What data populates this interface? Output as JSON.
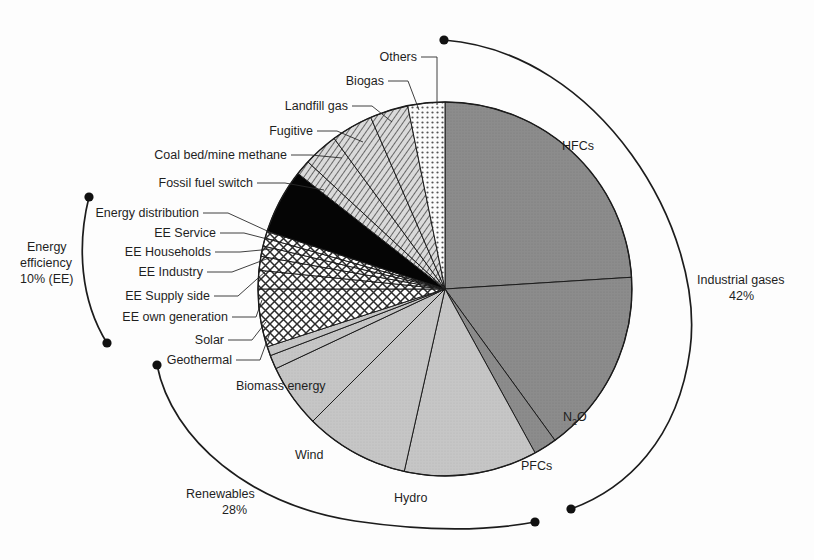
{
  "chart_data": {
    "type": "pie",
    "title": "",
    "subtitle": "",
    "xlabel": "",
    "ylabel": "",
    "legend_position": "callout-labels",
    "grid": false,
    "total_percent": 100,
    "units": "percent",
    "start_angle_deg": -90,
    "direction": "clockwise",
    "groups": [
      {
        "name": "Industrial gases",
        "percent": 42,
        "label": "Industrial gases",
        "value_label": "42%"
      },
      {
        "name": "Renewables",
        "percent": 28,
        "label": "Renewables",
        "value_label": "28%"
      },
      {
        "name": "Energy efficiency",
        "percent": 10,
        "label": "Energy efficiency",
        "value_label": "10% (EE)"
      }
    ],
    "categories": [
      "HFCs",
      "N2O",
      "PFCs",
      "Hydro",
      "Wind",
      "Biomass energy",
      "Geothermal",
      "Solar",
      "EE own generation",
      "EE Supply side",
      "EE Industry",
      "EE Households",
      "EE Service",
      "Energy distribution",
      "Fossil fuel switch",
      "Coal bed/mine methane",
      "Fugitive",
      "Landfill gas",
      "Biogas",
      "Others"
    ],
    "values": [
      24.0,
      16.0,
      2.0,
      11.5,
      9.0,
      5.5,
      1.2,
      0.8,
      5.0,
      1.6,
      1.2,
      0.9,
      0.7,
      0.6,
      5.6,
      1.3,
      3.0,
      3.6,
      3.3,
      3.2
    ],
    "slices": [
      {
        "label": "HFCs",
        "percent": 24.0,
        "fill": "darkgray",
        "group": "Industrial gases"
      },
      {
        "label": "N2O",
        "percent": 16.0,
        "fill": "darkgray",
        "group": "Industrial gases"
      },
      {
        "label": "PFCs",
        "percent": 2.0,
        "fill": "darkgray",
        "group": "Industrial gases"
      },
      {
        "label": "Hydro",
        "percent": 11.5,
        "fill": "lightgray",
        "group": "Renewables"
      },
      {
        "label": "Wind",
        "percent": 9.0,
        "fill": "lightgray",
        "group": "Renewables"
      },
      {
        "label": "Biomass energy",
        "percent": 5.5,
        "fill": "lightgray",
        "group": "Renewables"
      },
      {
        "label": "Geothermal",
        "percent": 1.2,
        "fill": "lightgray",
        "group": "Renewables"
      },
      {
        "label": "Solar",
        "percent": 0.8,
        "fill": "lightgray",
        "group": "Renewables"
      },
      {
        "label": "EE own generation",
        "percent": 5.0,
        "fill": "crosshatch",
        "group": "Energy efficiency"
      },
      {
        "label": "EE Supply side",
        "percent": 1.6,
        "fill": "crosshatch",
        "group": "Energy efficiency"
      },
      {
        "label": "EE Industry",
        "percent": 1.2,
        "fill": "crosshatch",
        "group": "Energy efficiency"
      },
      {
        "label": "EE Households",
        "percent": 0.9,
        "fill": "crosshatch",
        "group": "Energy efficiency"
      },
      {
        "label": "EE Service",
        "percent": 0.7,
        "fill": "crosshatch",
        "group": "Energy efficiency"
      },
      {
        "label": "Energy distribution",
        "percent": 0.6,
        "fill": "crosshatch",
        "group": "Energy efficiency"
      },
      {
        "label": "Fossil fuel switch",
        "percent": 5.6,
        "fill": "black",
        "group": ""
      },
      {
        "label": "Coal bed/mine methane",
        "percent": 1.3,
        "fill": "diagonal",
        "group": ""
      },
      {
        "label": "Fugitive",
        "percent": 3.0,
        "fill": "diagonal",
        "group": ""
      },
      {
        "label": "Landfill gas",
        "percent": 3.6,
        "fill": "diagonal",
        "group": ""
      },
      {
        "label": "Biogas",
        "percent": 3.3,
        "fill": "diagonal",
        "group": ""
      },
      {
        "label": "Others",
        "percent": 3.2,
        "fill": "dotted",
        "group": ""
      }
    ]
  },
  "labels": {
    "others": "Others",
    "biogas": "Biogas",
    "landfill_gas": "Landfill gas",
    "fugitive": "Fugitive",
    "coal_bed_mine_methane": "Coal bed/mine methane",
    "fossil_fuel_switch": "Fossil fuel switch",
    "energy_distribution": "Energy distribution",
    "ee_service": "EE Service",
    "ee_households": "EE Households",
    "ee_industry": "EE Industry",
    "ee_supply_side": "EE Supply side",
    "ee_own_generation": "EE own generation",
    "solar": "Solar",
    "geothermal": "Geothermal",
    "biomass_energy": "Biomass energy",
    "wind": "Wind",
    "hydro": "Hydro",
    "pfcs": "PFCs",
    "n2o_main": "N",
    "n2o_sub": "2",
    "n2o_tail": "O",
    "hfcs": "HFCs",
    "industrial_gases": "Industrial gases",
    "industrial_gases_pct": "42%",
    "renewables": "Renewables",
    "renewables_pct": "28%",
    "energy_efficiency_1": "Energy",
    "energy_efficiency_2": "efficiency",
    "energy_efficiency_3": "10% (EE)"
  },
  "colors": {
    "dark_gray": "#8c8c8c",
    "light_gray": "#c6c6c6",
    "black": "#050505",
    "white": "#ffffff",
    "stroke": "#1c1c1c",
    "background": "#fdfdfd"
  }
}
